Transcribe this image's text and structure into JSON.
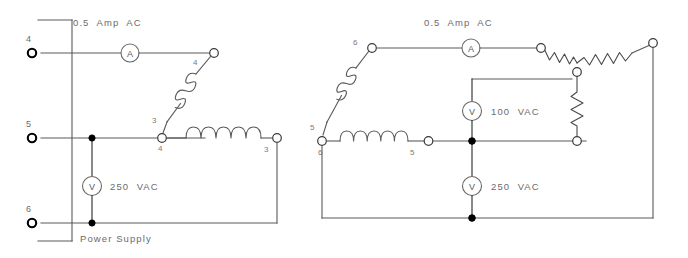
{
  "diagram": {
    "background_color": "#ffffff",
    "line_color": "#5a5a5a",
    "text_color": "#6b6b6b"
  },
  "left_circuit": {
    "name": "left-circuit",
    "source_label": "Power Supply",
    "current_label": "0.5  Amp  AC",
    "voltmeter_label": "250  VAC",
    "ammeter_glyph": "A",
    "voltmeter_glyph": "V",
    "supply_terminals": [
      {
        "label": "4",
        "kind": "open-ring"
      },
      {
        "label": "5",
        "kind": "open-ring"
      },
      {
        "label": "6",
        "kind": "open-ring"
      }
    ],
    "node_labels": [
      {
        "label": "4",
        "position": "top-right-coil-end"
      },
      {
        "label": "3",
        "position": "mid-coil-upper"
      },
      {
        "label": "4",
        "position": "mid-left-node"
      },
      {
        "label": "3",
        "position": "mid-right-node"
      }
    ],
    "junction_dots": 2,
    "coils": 2
  },
  "right_circuit": {
    "name": "right-circuit",
    "current_label": "0.5  Amp  AC",
    "voltmeter_upper_label": "100  VAC",
    "voltmeter_lower_label": "250  VAC",
    "ammeter_glyph": "A",
    "voltmeter_glyph": "V",
    "node_labels": [
      {
        "label": "6",
        "position": "top-left-node"
      },
      {
        "label": "5",
        "position": "left-lower-node"
      },
      {
        "label": "6",
        "position": "mid-left-node"
      },
      {
        "label": "5",
        "position": "mid-coil-right-node"
      }
    ],
    "junction_dots": 2,
    "coils": 2,
    "resistors": 3,
    "resistor_topology": "wye"
  }
}
